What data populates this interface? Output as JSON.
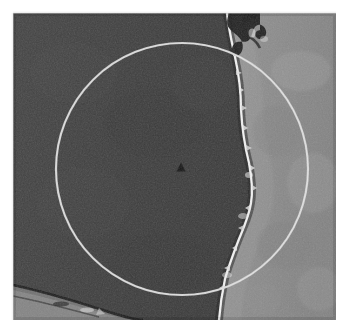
{
  "image": {
    "kind": "scanned-micrograph",
    "description": "Grayscale electron micrograph of a two-phase interface with a circular overlay annotation and a small solid triangular marker at the circle centre",
    "plate": {
      "left": 13,
      "top": 13,
      "width": 323,
      "height": 307
    },
    "page_background": "#ffffff"
  },
  "regions": {
    "dark_phase": {
      "label": "dark matrix phase",
      "fill": "#3b3b3b",
      "mean_gray_hex": "#3a3a3a",
      "side": "left"
    },
    "light_phase": {
      "label": "light phase",
      "fill": "#8c8c8c",
      "mean_gray_hex": "#8a8a8a",
      "side": "right"
    },
    "interface": {
      "label": "phase boundary",
      "highlight": "#e8e8e8",
      "shadow": "#1c1c1c",
      "description": "near-vertical irregular boundary running top to bottom, bowed right near mid-height"
    },
    "corner_feature": {
      "label": "bottom-left diagonal band",
      "fill": "#787878",
      "edge": "#1a1a1a"
    },
    "top_defect": {
      "label": "dark branching defect at boundary top",
      "fill": "#161616"
    }
  },
  "overlay": {
    "circle": {
      "name": "circle-annotation",
      "center_x": 182,
      "center_y": 169,
      "radius": 126,
      "stroke": "#d9d9d9",
      "stroke_width": 2.2,
      "fill": "none"
    },
    "marker": {
      "name": "triangle-marker",
      "shape": "triangle-up",
      "center_x": 181,
      "center_y": 167,
      "width": 9,
      "height": 9,
      "fill": "#111111"
    }
  },
  "chart_data": {
    "type": "scatter",
    "title": "",
    "xlabel": "",
    "ylabel": "",
    "annotations": [
      {
        "name": "circle-annotation",
        "shape": "circle",
        "cx": 182,
        "cy": 169,
        "r": 126
      },
      {
        "name": "triangle-marker",
        "shape": "triangle",
        "cx": 181,
        "cy": 167,
        "size": 9
      }
    ]
  }
}
